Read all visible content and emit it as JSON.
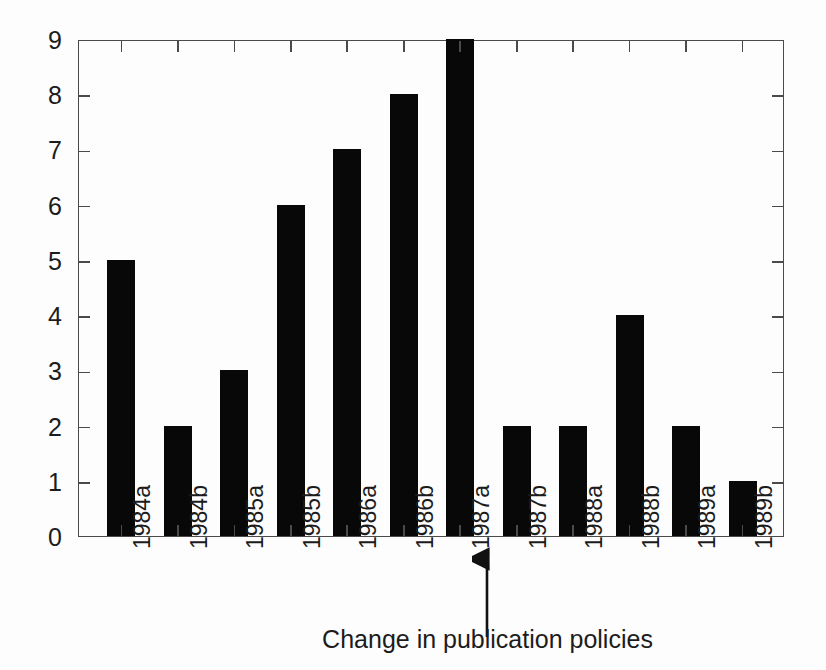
{
  "chart_data": {
    "type": "bar",
    "title": "",
    "subtitle": "",
    "xlabel": "Change in publication policies",
    "ylabel": "",
    "categories": [
      "1984a",
      "1984b",
      "1985a",
      "1985b",
      "1986a",
      "1986b",
      "1987a",
      "1987b",
      "1988a",
      "1988b",
      "1989a",
      "1989b"
    ],
    "values": [
      5,
      2,
      3,
      6,
      7,
      8,
      9,
      2,
      2,
      4,
      2,
      1
    ],
    "ylim": [
      0,
      9
    ],
    "yticks": [
      0,
      1,
      2,
      3,
      4,
      5,
      6,
      7,
      8,
      9
    ],
    "ytick_labels": [
      "0",
      "1",
      "2",
      "3",
      "4",
      "5",
      "6",
      "7",
      "8",
      "9"
    ],
    "grid": false,
    "legend": null,
    "bar_color": "#080808",
    "axis_color": "#4a4a4a",
    "background_color": "#fdfdfd",
    "xtick_label_rotation": -90,
    "annotations": [
      {
        "name": "policy-change-arrow",
        "type": "arrow",
        "direction": "up",
        "between_categories": [
          "1987a",
          "1987b"
        ],
        "label": "Change in publication policies"
      }
    ]
  }
}
